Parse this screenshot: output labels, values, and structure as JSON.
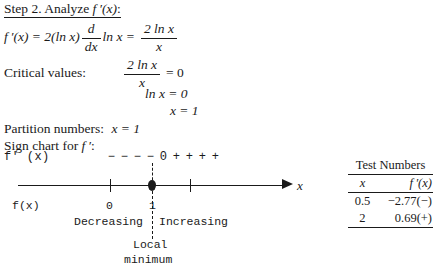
{
  "heading": {
    "step": "Step 2.",
    "text": "Analyze",
    "func": "f ′(x)",
    "colon": ":"
  },
  "derivative_line": {
    "lhs": "f ′(x) = 2(ln x)",
    "operator_num": "d",
    "operator_den": "dx",
    "mid": "ln x =",
    "frac_num": "2 ln x",
    "frac_den": "x"
  },
  "critical_values": {
    "label": "Critical values:",
    "eq1_num": "2 ln x",
    "eq1_den": "x",
    "eq1_rhs": "= 0",
    "eq2": "ln x = 0",
    "eq3": "x = 1"
  },
  "partition": {
    "label": "Partition numbers:",
    "value": "x = 1"
  },
  "sign_chart": {
    "label": "Sign chart for",
    "label_func": "f ′",
    "label_colon": ":",
    "row_label": "f' (x)",
    "signs": [
      "−",
      "−",
      "−",
      "−",
      "0",
      "+",
      "+",
      "+",
      "+"
    ]
  },
  "number_line": {
    "fx_label": "f(x)",
    "axis_var": "x",
    "ticks": [
      {
        "label": "0"
      },
      {
        "label": "1"
      }
    ],
    "intervals": {
      "left": "Decreasing",
      "right": "Increasing"
    },
    "annotation_line1": "Local",
    "annotation_line2": "minimum"
  },
  "test_numbers": {
    "title": "Test Numbers",
    "columns": [
      "x",
      "f ′(x)"
    ],
    "rows": [
      {
        "x": "0.5",
        "y": "−2.77(−)"
      },
      {
        "x": "2",
        "y": "0.69(+)"
      }
    ]
  },
  "colors": {
    "ink": "#1a1a1a",
    "page": "#ffffff"
  }
}
